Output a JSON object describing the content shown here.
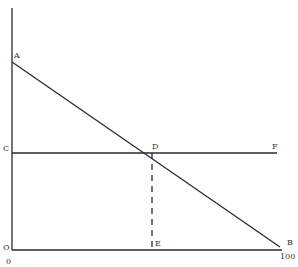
{
  "diagram": {
    "type": "economics-line-diagram",
    "points": {
      "A": "A",
      "B": "B",
      "C": "C",
      "D": "D",
      "E": "E",
      "F": "F",
      "O": "O"
    },
    "axis_ticks": {
      "x_start": "0",
      "x_end": "100"
    },
    "lines": [
      {
        "name": "AB",
        "from": "A",
        "to": "B",
        "style": "solid"
      },
      {
        "name": "CF",
        "from": "C",
        "to": "F",
        "style": "solid"
      },
      {
        "name": "DE",
        "from": "D",
        "to": "E",
        "style": "dashed"
      }
    ],
    "line_color": "#2a2a2a"
  }
}
